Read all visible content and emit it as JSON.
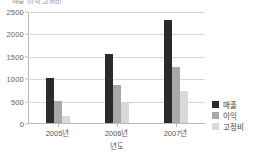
{
  "title_clipped": "매출 이익 고정비",
  "axis": {
    "xlabel": "년도",
    "ylabel": ""
  },
  "colors": {
    "series_1": "#2b2b2b",
    "series_2": "#a8a8a8",
    "series_3": "#d9d9d9",
    "grid": "#d6d6d6",
    "axis": "#b9b9b9",
    "text": "#555555",
    "background": "#ffffff"
  },
  "legend": {
    "position": "right",
    "items": [
      {
        "label": "매출",
        "color": "#2b2b2b"
      },
      {
        "label": "이익",
        "color": "#a8a8a8"
      },
      {
        "label": "고정비",
        "color": "#d9d9d9"
      }
    ]
  },
  "yticks": [
    {
      "value": 2500,
      "label": "2500"
    },
    {
      "value": 2000,
      "label": "2000"
    },
    {
      "value": 1500,
      "label": "1500"
    },
    {
      "value": 1000,
      "label": "1000"
    },
    {
      "value": 500,
      "label": "500"
    },
    {
      "value": 0,
      "label": "0"
    }
  ],
  "chart_data": {
    "type": "bar",
    "title": "",
    "xlabel": "년도",
    "ylabel": "",
    "ylim": [
      0,
      2500
    ],
    "grid": true,
    "legend_position": "right",
    "categories": [
      "2005년",
      "2006년",
      "2007년"
    ],
    "series": [
      {
        "name": "매출",
        "color": "#2b2b2b",
        "values": [
          1000,
          1550,
          2300
        ]
      },
      {
        "name": "이익",
        "color": "#a8a8a8",
        "values": [
          500,
          850,
          1250
        ]
      },
      {
        "name": "고정비",
        "color": "#d9d9d9",
        "values": [
          150,
          440,
          720
        ]
      }
    ]
  }
}
